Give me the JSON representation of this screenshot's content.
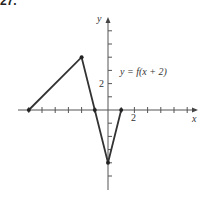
{
  "figure": {
    "label": "27."
  },
  "chart_data": {
    "type": "line",
    "title": "",
    "function_label": "y = f(x + 2)",
    "xlabel": "x",
    "ylabel": "y",
    "x_tick_label": "2",
    "y_tick_label": "2",
    "xlim": [
      -8,
      8
    ],
    "ylim": [
      -5,
      7
    ],
    "grid": false,
    "tick_spacing": 1,
    "series": [
      {
        "name": "y = f(x + 2)",
        "x": [
          -6,
          -2,
          -1,
          0,
          1
        ],
        "y": [
          0,
          4,
          0,
          -4,
          0
        ]
      }
    ],
    "marked_points": [
      [
        -6,
        0
      ],
      [
        -2,
        4
      ],
      [
        -1,
        0
      ],
      [
        0,
        -4
      ],
      [
        1,
        0
      ]
    ],
    "line_color": "#333333"
  },
  "labels": {
    "x_axis": "x",
    "y_axis": "y",
    "x_tick": "2",
    "y_tick": "2",
    "function": "y = f(x + 2)"
  }
}
